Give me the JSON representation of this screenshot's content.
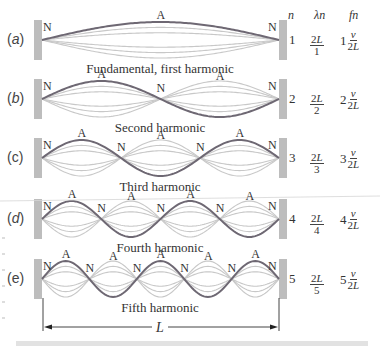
{
  "diagram": {
    "columns": {
      "n": "n",
      "lambda": "λn",
      "f": "fn"
    },
    "rows": [
      {
        "label": "(a)",
        "caption": "Fundamental, first harmonic",
        "n": "1",
        "lambda_num": "2L",
        "lambda_den": "1",
        "f_coef": "1",
        "f_num": "v",
        "f_den": "2L",
        "loops": 1,
        "nodes": [
          "N",
          "N"
        ],
        "antinodes": [
          "A"
        ]
      },
      {
        "label": "(b)",
        "caption": "Second harmonic",
        "n": "2",
        "lambda_num": "2L",
        "lambda_den": "2",
        "f_coef": "2",
        "f_num": "v",
        "f_den": "2L",
        "loops": 2,
        "nodes": [
          "N",
          "N",
          "N"
        ],
        "antinodes": [
          "A",
          "A"
        ]
      },
      {
        "label": "(c)",
        "caption": "Third harmonic",
        "n": "3",
        "lambda_num": "2L",
        "lambda_den": "3",
        "f_coef": "3",
        "f_num": "v",
        "f_den": "2L",
        "loops": 3,
        "nodes": [
          "N",
          "N",
          "N",
          "N"
        ],
        "antinodes": [
          "A",
          "A",
          "A"
        ]
      },
      {
        "label": "(d)",
        "caption": "Fourth harmonic",
        "n": "4",
        "lambda_num": "2L",
        "lambda_den": "4",
        "f_coef": "4",
        "f_num": "v",
        "f_den": "2L",
        "loops": 4,
        "nodes": [
          "N",
          "N",
          "N",
          "N",
          "N"
        ],
        "antinodes": [
          "A",
          "A",
          "A",
          "A"
        ]
      },
      {
        "label": "(e)",
        "caption": "Fifth harmonic",
        "n": "5",
        "lambda_num": "2L",
        "lambda_den": "5",
        "f_coef": "5",
        "f_num": "v",
        "f_den": "2L",
        "loops": 5,
        "nodes": [
          "N",
          "N",
          "N",
          "N",
          "N",
          "N"
        ],
        "antinodes": [
          "A",
          "A",
          "A",
          "A",
          "A"
        ]
      }
    ],
    "length_label": "L",
    "colors": {
      "string": "#6e6873",
      "envelope": "#c8c8c8",
      "support": "#bdbdbd",
      "footer_bar": "#e2e2e2"
    }
  }
}
